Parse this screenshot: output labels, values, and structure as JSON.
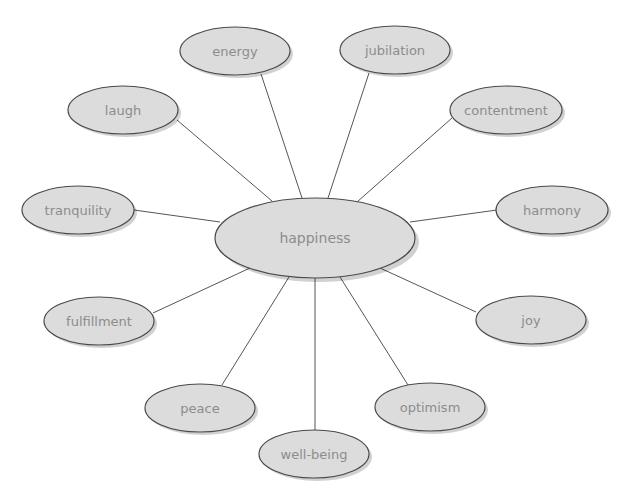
{
  "diagram": {
    "type": "word-web",
    "center": {
      "label": "happiness",
      "cx": 315,
      "cy": 238,
      "rx": 100,
      "ry": 40
    },
    "nodes": [
      {
        "id": "energy",
        "label": "energy",
        "cx": 235,
        "cy": 51,
        "rx": 55,
        "ry": 24
      },
      {
        "id": "jubilation",
        "label": "jubilation",
        "cx": 395,
        "cy": 50,
        "rx": 55,
        "ry": 24
      },
      {
        "id": "laugh",
        "label": "laugh",
        "cx": 123,
        "cy": 110,
        "rx": 55,
        "ry": 24
      },
      {
        "id": "contentment",
        "label": "contentment",
        "cx": 506,
        "cy": 110,
        "rx": 56,
        "ry": 24
      },
      {
        "id": "tranquility",
        "label": "tranquility",
        "cx": 78,
        "cy": 210,
        "rx": 56,
        "ry": 24
      },
      {
        "id": "harmony",
        "label": "harmony",
        "cx": 552,
        "cy": 210,
        "rx": 56,
        "ry": 24
      },
      {
        "id": "fulfillment",
        "label": "fulfillment",
        "cx": 99,
        "cy": 321,
        "rx": 55,
        "ry": 24
      },
      {
        "id": "joy",
        "label": "joy",
        "cx": 531,
        "cy": 320,
        "rx": 55,
        "ry": 24
      },
      {
        "id": "peace",
        "label": "peace",
        "cx": 200,
        "cy": 408,
        "rx": 55,
        "ry": 24
      },
      {
        "id": "optimism",
        "label": "optimism",
        "cx": 430,
        "cy": 407,
        "rx": 55,
        "ry": 24
      },
      {
        "id": "well-being",
        "label": "well-being",
        "cx": 314,
        "cy": 454,
        "rx": 55,
        "ry": 24
      }
    ],
    "edges": [
      {
        "to": "energy",
        "x1": 302,
        "y1": 198,
        "x2": 261,
        "y2": 74
      },
      {
        "to": "jubilation",
        "x1": 328,
        "y1": 198,
        "x2": 369,
        "y2": 73
      },
      {
        "to": "laugh",
        "x1": 272,
        "y1": 201,
        "x2": 177,
        "y2": 120
      },
      {
        "to": "contentment",
        "x1": 357,
        "y1": 202,
        "x2": 452,
        "y2": 118
      },
      {
        "to": "tranquility",
        "x1": 220,
        "y1": 222,
        "x2": 134,
        "y2": 210
      },
      {
        "to": "harmony",
        "x1": 410,
        "y1": 222,
        "x2": 497,
        "y2": 210
      },
      {
        "to": "fulfillment",
        "x1": 250,
        "y1": 268,
        "x2": 153,
        "y2": 313
      },
      {
        "to": "joy",
        "x1": 380,
        "y1": 268,
        "x2": 476,
        "y2": 312
      },
      {
        "to": "peace",
        "x1": 289,
        "y1": 277,
        "x2": 222,
        "y2": 385
      },
      {
        "to": "optimism",
        "x1": 340,
        "y1": 277,
        "x2": 408,
        "y2": 385
      },
      {
        "to": "well-being",
        "x1": 315,
        "y1": 278,
        "x2": 315,
        "y2": 430
      }
    ],
    "colors": {
      "node_fill": "#dcdcdc",
      "node_stroke": "#4a4a4a",
      "label": "#8c8c8c",
      "edge": "#555555",
      "background": "#ffffff"
    }
  }
}
